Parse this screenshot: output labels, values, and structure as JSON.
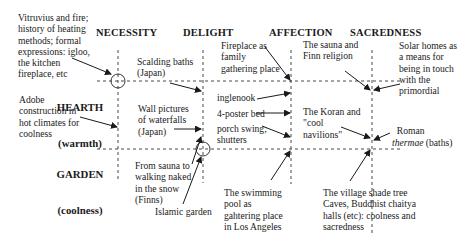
{
  "columns": [
    {
      "label": "NECESSITY",
      "x": 118
    },
    {
      "label": "DELIGHT",
      "x": 203
    },
    {
      "label": "AFFECTION",
      "x": 291
    },
    {
      "label": "SACREDNESS",
      "x": 372
    }
  ],
  "rows": [
    {
      "label": "HEARTH",
      "sub": "(warmth)",
      "y": 81
    },
    {
      "label": "GARDEN",
      "sub": "(coolness)",
      "y": 149
    }
  ],
  "annotations": {
    "vitruvius": "Vitruvius and fire;\nhistory of heating\nmethods; formal\nexpressions: igloo,\nthe kitchen\nfireplace, etc",
    "adobe": "Adobe\nconstruction in\nhot climates for\ncoolness",
    "scalding": "Scalding baths\n(Japan)",
    "wall_pictures": "Wall pictures\nof waterfalls\n(Japan)",
    "from_sauna": "From sauna to\nwalking naked\nin the snow\n(Finns)",
    "islamic_garden": "Islamic garden",
    "fireplace": "Fireplace as\nfamily\ngathering place",
    "inglenook": "inglenook",
    "four_poster": "4-poster bed",
    "porch_swing": "porch swing;\nshutters",
    "swimming_pool": "The swimming\npool as\ngahtering place\nin Los Angeles",
    "sauna_finn": "The sauna and\nFinn religion",
    "koran": "The Koran and\n\"cool\nnavilions\"",
    "solar_homes": "Solar homes as\na means for\nbeing in touch\nwith the\nprimordial",
    "roman_1": "Roman",
    "roman_thermae": "thermae",
    "roman_baths": " (baths)",
    "village": "The village shade tree\nCaves, Buddhist chaitya\nhalls (etc): coolness and\nsacredness"
  }
}
